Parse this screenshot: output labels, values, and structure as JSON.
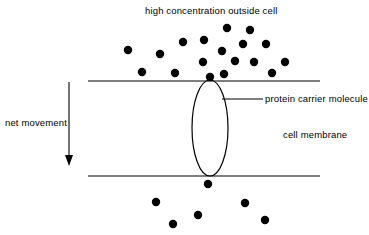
{
  "diagram": {
    "type": "biology-diagram",
    "background_color": "#ffffff",
    "stroke_color": "#000000",
    "particle_color": "#000000",
    "labels": {
      "top_concentration": "high concentration outside cell",
      "net_movement": "net movement",
      "protein_carrier": "protein carrier molecule",
      "cell_membrane": "cell membrane"
    },
    "membrane": {
      "top_line": {
        "x1": 88,
        "y1": 81,
        "x2": 320,
        "y2": 81
      },
      "bottom_line": {
        "x1": 88,
        "y1": 176,
        "x2": 320,
        "y2": 176
      }
    },
    "protein_channel": {
      "shape": "ellipse",
      "cx": 210,
      "cy": 128,
      "rx": 18,
      "ry": 48
    },
    "leader_line": {
      "x1": 222,
      "y1": 99,
      "x2": 263,
      "y2": 99
    },
    "net_movement_arrow": {
      "x": 69,
      "y_start": 82,
      "y_end": 166,
      "direction": "down"
    },
    "particle_radius": 4.2,
    "particles_outside": [
      {
        "x": 128,
        "y": 50
      },
      {
        "x": 160,
        "y": 54
      },
      {
        "x": 183,
        "y": 42
      },
      {
        "x": 142,
        "y": 72
      },
      {
        "x": 175,
        "y": 73
      },
      {
        "x": 204,
        "y": 40
      },
      {
        "x": 227,
        "y": 28
      },
      {
        "x": 250,
        "y": 30
      },
      {
        "x": 243,
        "y": 44
      },
      {
        "x": 266,
        "y": 44
      },
      {
        "x": 222,
        "y": 51
      },
      {
        "x": 203,
        "y": 62
      },
      {
        "x": 235,
        "y": 61
      },
      {
        "x": 254,
        "y": 62
      },
      {
        "x": 285,
        "y": 62
      },
      {
        "x": 224,
        "y": 74
      },
      {
        "x": 272,
        "y": 73
      },
      {
        "x": 210,
        "y": 77
      }
    ],
    "particles_inside": [
      {
        "x": 208,
        "y": 184
      },
      {
        "x": 156,
        "y": 202
      },
      {
        "x": 245,
        "y": 203
      },
      {
        "x": 198,
        "y": 215
      },
      {
        "x": 173,
        "y": 224
      },
      {
        "x": 265,
        "y": 220
      }
    ]
  }
}
